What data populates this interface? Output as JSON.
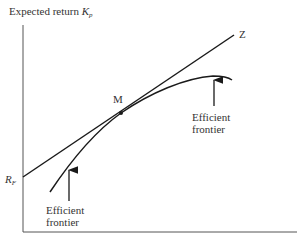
{
  "diagram": {
    "type": "capital market line / efficient frontier",
    "y_axis": {
      "label": "Expected return",
      "symbol": "K",
      "symbol_sub": "p"
    },
    "x_axis": {
      "label": ""
    },
    "risk_free": {
      "symbol": "R",
      "symbol_sub": "F"
    },
    "line_end_label": "Z",
    "tangency_point_label": "M",
    "annotations": [
      {
        "line1": "Efficient",
        "line2": "frontier",
        "position": "lower-left"
      },
      {
        "line1": "Efficient",
        "line2": "frontier",
        "position": "upper-right"
      }
    ],
    "colors": {
      "line": "#1a1a1a",
      "axis": "#555555",
      "text": "#333333"
    }
  }
}
